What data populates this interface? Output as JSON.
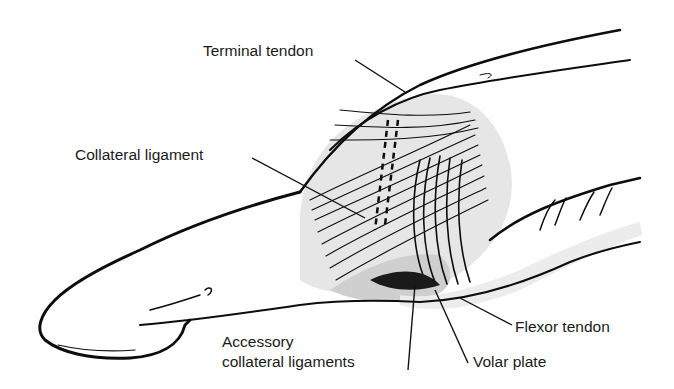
{
  "figure": {
    "labels": [
      {
        "id": "terminal-tendon",
        "text": "Terminal tendon"
      },
      {
        "id": "collateral-ligament",
        "text": "Collateral ligament"
      },
      {
        "id": "accessory-collateral-ligaments",
        "line1": "Accessory",
        "line2": "collateral ligaments"
      },
      {
        "id": "flexor-tendon",
        "text": "Flexor tendon"
      },
      {
        "id": "volar-plate",
        "text": "Volar plate"
      }
    ]
  }
}
